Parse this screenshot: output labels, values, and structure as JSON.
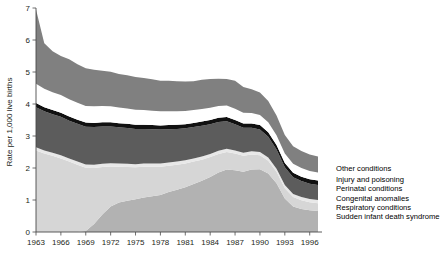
{
  "chart_data": {
    "type": "area",
    "stacked": true,
    "title": "",
    "xlabel": "",
    "ylabel": "Rate per 1,000 live births",
    "ylim": [
      0,
      7
    ],
    "yticks": [
      0,
      1,
      2,
      3,
      4,
      5,
      6,
      7
    ],
    "xlim": [
      1963,
      1997
    ],
    "xticks": [
      1963,
      1966,
      1969,
      1972,
      1975,
      1978,
      1981,
      1984,
      1987,
      1990,
      1993,
      1996
    ],
    "grid": false,
    "legend_position": "right",
    "x": [
      1963,
      1964,
      1965,
      1966,
      1967,
      1968,
      1969,
      1970,
      1971,
      1972,
      1973,
      1974,
      1975,
      1976,
      1977,
      1978,
      1979,
      1980,
      1981,
      1982,
      1983,
      1984,
      1985,
      1986,
      1987,
      1988,
      1989,
      1990,
      1991,
      1992,
      1993,
      1994,
      1995,
      1996,
      1997
    ],
    "series": [
      {
        "name": "Sudden infant death syndrome",
        "color": "#b2b2b2",
        "values": [
          0,
          0,
          0,
          0,
          0,
          0,
          0.03,
          0.25,
          0.55,
          0.8,
          0.92,
          0.98,
          1.02,
          1.08,
          1.12,
          1.16,
          1.25,
          1.32,
          1.4,
          1.5,
          1.6,
          1.72,
          1.86,
          1.95,
          1.93,
          1.88,
          1.95,
          1.96,
          1.83,
          1.52,
          1.05,
          0.8,
          0.72,
          0.68,
          0.66
        ]
      },
      {
        "name": "Respiratory conditions",
        "color": "#d6d6d6",
        "values": [
          2.55,
          2.45,
          2.38,
          2.3,
          2.2,
          2.1,
          1.98,
          1.75,
          1.48,
          1.25,
          1.12,
          1.05,
          1.0,
          0.96,
          0.92,
          0.88,
          0.82,
          0.78,
          0.74,
          0.7,
          0.66,
          0.62,
          0.58,
          0.55,
          0.52,
          0.5,
          0.47,
          0.44,
          0.4,
          0.36,
          0.32,
          0.29,
          0.27,
          0.25,
          0.24
        ]
      },
      {
        "name": "Congenital anomalies",
        "color": "#e8e8e8",
        "values": [
          0.1,
          0.1,
          0.1,
          0.1,
          0.1,
          0.1,
          0.1,
          0.1,
          0.1,
          0.1,
          0.1,
          0.1,
          0.1,
          0.1,
          0.1,
          0.1,
          0.1,
          0.1,
          0.1,
          0.1,
          0.1,
          0.1,
          0.1,
          0.1,
          0.1,
          0.1,
          0.1,
          0.1,
          0.1,
          0.1,
          0.1,
          0.1,
          0.1,
          0.1,
          0.1
        ]
      },
      {
        "name": "Perinatal conditions",
        "color": "#5c5c5c",
        "values": [
          1.25,
          1.22,
          1.2,
          1.2,
          1.18,
          1.18,
          1.18,
          1.18,
          1.17,
          1.15,
          1.13,
          1.12,
          1.1,
          1.08,
          1.07,
          1.06,
          1.04,
          1.02,
          1.0,
          0.98,
          0.96,
          0.93,
          0.9,
          0.86,
          0.82,
          0.78,
          0.74,
          0.7,
          0.65,
          0.6,
          0.55,
          0.52,
          0.5,
          0.48,
          0.47
        ]
      },
      {
        "name": "Injury and poisoning",
        "color": "#111111",
        "values": [
          0.13,
          0.13,
          0.13,
          0.13,
          0.13,
          0.13,
          0.13,
          0.13,
          0.13,
          0.13,
          0.13,
          0.13,
          0.13,
          0.13,
          0.13,
          0.13,
          0.13,
          0.13,
          0.13,
          0.13,
          0.13,
          0.13,
          0.13,
          0.13,
          0.13,
          0.13,
          0.13,
          0.14,
          0.14,
          0.14,
          0.14,
          0.14,
          0.14,
          0.14,
          0.14
        ]
      },
      {
        "name": "Other conditions",
        "color": "#ffffff",
        "values": [
          0.6,
          0.58,
          0.56,
          0.55,
          0.54,
          0.53,
          0.52,
          0.52,
          0.51,
          0.5,
          0.49,
          0.48,
          0.47,
          0.46,
          0.45,
          0.44,
          0.43,
          0.42,
          0.41,
          0.4,
          0.39,
          0.38,
          0.37,
          0.36,
          0.35,
          0.34,
          0.33,
          0.32,
          0.31,
          0.3,
          0.29,
          0.28,
          0.27,
          0.26,
          0.25
        ]
      },
      {
        "name": "Other conditions (top band)",
        "color": "#808080",
        "values": [
          2.32,
          1.42,
          1.28,
          1.22,
          1.25,
          1.2,
          1.18,
          1.14,
          1.1,
          1.08,
          1.05,
          1.04,
          1.02,
          1.0,
          0.98,
          0.96,
          0.96,
          0.94,
          0.92,
          0.9,
          0.92,
          0.9,
          0.85,
          0.83,
          0.88,
          0.8,
          0.74,
          0.7,
          0.66,
          0.62,
          0.58,
          0.55,
          0.53,
          0.51,
          0.5
        ]
      }
    ]
  },
  "legend": {
    "items": [
      {
        "label": "Other conditions",
        "color": "#808080"
      },
      {
        "label": "Injury and poisoning",
        "color": "#ffffff"
      },
      {
        "label": "Perinatal conditions",
        "color": "#111111"
      },
      {
        "label": "Congenital anomalies",
        "color": "#5c5c5c"
      },
      {
        "label": "Respiratory conditions",
        "color": "#d6d6d6"
      },
      {
        "label": "Sudden infant death syndrome",
        "color": "#b2b2b2"
      }
    ]
  }
}
